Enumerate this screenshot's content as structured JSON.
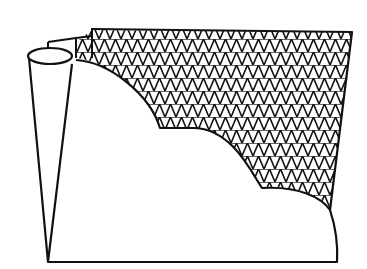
{
  "illustration": {
    "subject": "folded sheet with cross-hatched mesh region and scalloped cloud edge",
    "colors": {
      "background": "#ffffff",
      "ink": "#111111"
    }
  }
}
